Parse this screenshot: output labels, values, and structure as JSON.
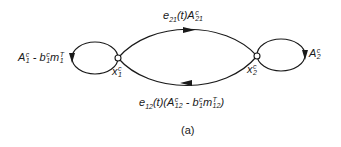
{
  "diagram": {
    "caption": "(a)",
    "nodes": [
      {
        "id": "x1",
        "label_base": "x",
        "label_sup": "c",
        "label_sub": "1"
      },
      {
        "id": "x2",
        "label_base": "x",
        "label_sup": "c",
        "label_sub": "2"
      }
    ],
    "edges": [
      {
        "from": "x1",
        "to": "x1",
        "type": "self-loop",
        "label": "A1^c - b1^c m1^T",
        "parts": {
          "a": "A",
          "a_sup": "c",
          "a_sub": "1",
          "minus": " - ",
          "b": "b",
          "b_sup": "c",
          "b_sub": "1",
          "m": "m",
          "m_sup": "T",
          "m_sub": "1"
        }
      },
      {
        "from": "x1",
        "to": "x2",
        "type": "arc-top",
        "label": "e21(t) A21^c",
        "parts": {
          "e": "e",
          "e_sub": "21",
          "t": "(t)",
          "a": "A",
          "a_sup": "c",
          "a_sub": "21"
        }
      },
      {
        "from": "x2",
        "to": "x1",
        "type": "arc-bottom",
        "label": "e12(t)(A12^c - b1^c m12^T)",
        "parts": {
          "e": "e",
          "e_sub": "12",
          "t": "(t)(",
          "a": "A",
          "a_sup": "c",
          "a_sub": "12",
          "minus": " - ",
          "b": "b",
          "b_sup": "c",
          "b_sub": "1",
          "m": "m",
          "m_sup": "T",
          "m_sub": "12",
          "close": ")"
        }
      },
      {
        "from": "x2",
        "to": "x2",
        "type": "self-loop",
        "label": "A2^c",
        "parts": {
          "a": "A",
          "a_sup": "c",
          "a_sub": "2"
        }
      }
    ],
    "colors": {
      "stroke": "#1a1a1a",
      "background": "#ffffff"
    }
  }
}
